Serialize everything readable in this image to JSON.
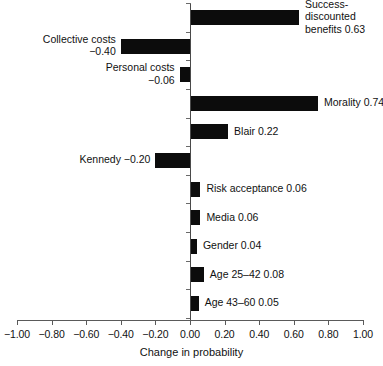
{
  "chart_data": {
    "type": "bar",
    "orientation": "horizontal",
    "title": "",
    "xlabel": "Change in probability",
    "ylabel": "",
    "xlim": [
      -1.0,
      1.0
    ],
    "ylim": null,
    "grid": false,
    "legend": null,
    "bar_color": "#0c0c0c",
    "background_color": "#ffffff",
    "axis_color": "#4a4a4a",
    "xticks": [
      -1.0,
      -0.8,
      -0.6,
      -0.4,
      -0.2,
      0.0,
      0.2,
      0.4,
      0.6,
      0.8,
      1.0
    ],
    "xticklabels": [
      "-1.00",
      "-0.80",
      "-0.60",
      "-0.40",
      "-0.20",
      "0.00",
      "0.20",
      "0.40",
      "0.60",
      "0.80",
      "1.00"
    ],
    "categories": [
      "Success-discounted benefits",
      "Collective costs",
      "Personal costs",
      "Morality",
      "Blair",
      "Kennedy",
      "Risk acceptance",
      "Media",
      "Gender",
      "Age 25-42",
      "Age 43-60"
    ],
    "values": [
      0.63,
      -0.4,
      -0.06,
      0.74,
      0.22,
      -0.2,
      0.06,
      0.06,
      0.04,
      0.08,
      0.05
    ],
    "annotations": [
      "Success-\ndiscounted\nbenefits 0.63",
      "Collective costs\n−0.40",
      "Personal costs\n−0.06",
      "Morality 0.74",
      "Blair 0.22",
      "Kennedy −0.20",
      "Risk acceptance 0.06",
      "Media 0.06",
      "Gender 0.04",
      "Age 25–42 0.08",
      "Age 43–60 0.05"
    ]
  },
  "axis": {
    "x_title": "Change in probability",
    "ticks": [
      {
        "value": "-1.00",
        "label": "−1.00"
      },
      {
        "value": "-0.80",
        "label": "−0.80"
      },
      {
        "value": "-0.60",
        "label": "−0.60"
      },
      {
        "value": "-0.40",
        "label": "−0.40"
      },
      {
        "value": "-0.20",
        "label": "−0.20"
      },
      {
        "value": "0.00",
        "label": "0.00"
      },
      {
        "value": "0.20",
        "label": "0.20"
      },
      {
        "value": "0.40",
        "label": "0.40"
      },
      {
        "value": "0.60",
        "label": "0.60"
      },
      {
        "value": "0.80",
        "label": "0.80"
      },
      {
        "value": "1.00",
        "label": "1.00"
      }
    ]
  },
  "bars": [
    {
      "name": "success-discounted-benefits",
      "value": 0.63,
      "label_line1": "Success-",
      "label_line2": "discounted",
      "label_line3": "benefits 0.63",
      "label_side": "right"
    },
    {
      "name": "collective-costs",
      "value": -0.4,
      "label_line1": "Collective costs",
      "label_line2": "−0.40",
      "label_line3": "",
      "label_side": "left"
    },
    {
      "name": "personal-costs",
      "value": -0.06,
      "label_line1": "Personal costs",
      "label_line2": "−0.06",
      "label_line3": "",
      "label_side": "left"
    },
    {
      "name": "morality",
      "value": 0.74,
      "label_line1": "Morality 0.74",
      "label_line2": "",
      "label_line3": "",
      "label_side": "right"
    },
    {
      "name": "blair",
      "value": 0.22,
      "label_line1": "Blair 0.22",
      "label_line2": "",
      "label_line3": "",
      "label_side": "right"
    },
    {
      "name": "kennedy",
      "value": -0.2,
      "label_line1": "Kennedy −0.20",
      "label_line2": "",
      "label_line3": "",
      "label_side": "left"
    },
    {
      "name": "risk-acceptance",
      "value": 0.06,
      "label_line1": "Risk acceptance 0.06",
      "label_line2": "",
      "label_line3": "",
      "label_side": "right"
    },
    {
      "name": "media",
      "value": 0.06,
      "label_line1": "Media 0.06",
      "label_line2": "",
      "label_line3": "",
      "label_side": "right"
    },
    {
      "name": "gender",
      "value": 0.04,
      "label_line1": "Gender 0.04",
      "label_line2": "",
      "label_line3": "",
      "label_side": "right"
    },
    {
      "name": "age-25-42",
      "value": 0.08,
      "label_line1": "Age 25–42 0.08",
      "label_line2": "",
      "label_line3": "",
      "label_side": "right"
    },
    {
      "name": "age-43-60",
      "value": 0.05,
      "label_line1": "Age 43–60 0.05",
      "label_line2": "",
      "label_line3": "",
      "label_side": "right"
    }
  ]
}
